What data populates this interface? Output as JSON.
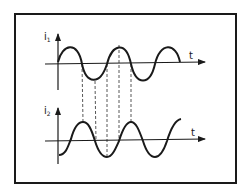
{
  "diagram": {
    "top_plot": {
      "y_label": "i",
      "y_label_sub": "1",
      "x_label": "t"
    },
    "bottom_plot": {
      "y_label": "i",
      "y_label_sub": "2",
      "x_label": "t"
    },
    "colors": {
      "stroke": "#1a1a1a",
      "dash": "#444444",
      "background": "#ffffff"
    }
  }
}
